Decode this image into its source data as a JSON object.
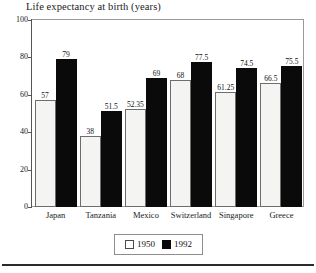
{
  "chart_data": {
    "type": "bar",
    "title": "Life expectancy at birth (years)",
    "xlabel": "",
    "ylabel": "",
    "ylim": [
      0,
      100
    ],
    "yticks": [
      0,
      20,
      40,
      60,
      80,
      100
    ],
    "ytick_labels": [
      "0",
      "20",
      "40",
      "60",
      "80",
      "100"
    ],
    "grid": false,
    "legend_position": "bottom-center",
    "categories": [
      "Japan",
      "Tanzania",
      "Mexico",
      "Switzerland",
      "Singapore",
      "Greece"
    ],
    "series": [
      {
        "name": "1950",
        "color": "#f4f4f2",
        "values": [
          57,
          38,
          52.35,
          68,
          61.25,
          66.5
        ],
        "value_labels": [
          "57",
          "38",
          "52.35",
          "68",
          "61.25",
          "66.5"
        ]
      },
      {
        "name": "1992",
        "color": "#0a0a0a",
        "values": [
          79,
          51.5,
          69,
          77.5,
          74.5,
          75.5
        ],
        "value_labels": [
          "79",
          "51.5",
          "69",
          "77.5",
          "74.5",
          "75.5"
        ]
      }
    ]
  },
  "legend": {
    "entries": [
      {
        "label": "1950",
        "swatch": "white-square-icon"
      },
      {
        "label": "1992",
        "swatch": "black-square-icon"
      }
    ]
  }
}
